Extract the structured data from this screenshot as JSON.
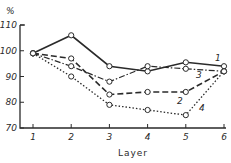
{
  "chart_data": {
    "type": "line",
    "title": "",
    "xlabel": "Layer",
    "ylabel": "%",
    "x": [
      1,
      2,
      3,
      4,
      5,
      6
    ],
    "xticks": [
      "1",
      "2",
      "3",
      "4",
      "5",
      "6"
    ],
    "yticks": [
      "110",
      "100",
      "90",
      "80",
      "70"
    ],
    "ylim": [
      70,
      110
    ],
    "grid": false,
    "legend": "inline numeric labels at line ends",
    "series": [
      {
        "name": "1",
        "style": "solid",
        "values": [
          99,
          106,
          94,
          92,
          95.5,
          94
        ]
      },
      {
        "name": "2",
        "style": "dashed",
        "values": [
          99,
          97,
          83,
          84,
          84,
          92
        ]
      },
      {
        "name": "3",
        "style": "dash-dot",
        "values": [
          99,
          94,
          88,
          94,
          93,
          92
        ]
      },
      {
        "name": "4",
        "style": "dotted",
        "values": [
          99,
          90,
          79,
          77,
          75,
          92
        ]
      }
    ]
  },
  "colors": {
    "line": "#2a2a2a",
    "background": "#ffffff"
  }
}
